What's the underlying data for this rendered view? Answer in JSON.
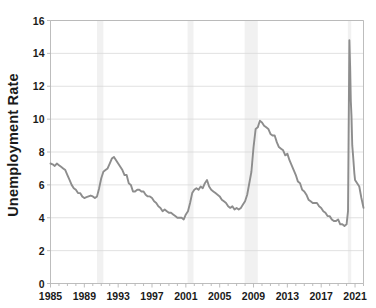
{
  "chart": {
    "ylabel_text": "Unemployment Rate",
    "line_color": "#8d8d8d",
    "recession_band_color": "#f1f1f1",
    "grid_color": "#d9d9d9",
    "axis_color": "#b5b5b5",
    "background_color": "#ffffff"
  },
  "chart_data": {
    "type": "line",
    "title": "",
    "subtitle": "",
    "xlabel": "",
    "ylabel": "Unemployment Rate",
    "xlim": [
      1985,
      2022
    ],
    "ylim": [
      0,
      16
    ],
    "ytick_labels": [
      "0",
      "2",
      "4",
      "6",
      "8",
      "10",
      "12",
      "14",
      "16"
    ],
    "ytick_values": [
      0,
      2,
      4,
      6,
      8,
      10,
      12,
      14,
      16
    ],
    "xtick_labels": [
      "1985",
      "1989",
      "1993",
      "1997",
      "2001",
      "2005",
      "2009",
      "2013",
      "2017",
      "2021"
    ],
    "xtick_values": [
      1985,
      1989,
      1993,
      1997,
      2001,
      2005,
      2009,
      2013,
      2017,
      2021
    ],
    "grid": "horizontal",
    "legend": "none",
    "annotations": [
      {
        "label": "recession band",
        "x_start": 1990.5,
        "x_end": 1991.25
      },
      {
        "label": "recession band",
        "x_start": 2001.2,
        "x_end": 2001.9
      },
      {
        "label": "recession band",
        "x_start": 2007.95,
        "x_end": 2009.5
      },
      {
        "label": "recession band",
        "x_start": 2020.15,
        "x_end": 2020.55
      }
    ],
    "series": [
      {
        "name": "Unemployment Rate",
        "color": "#8d8d8d",
        "x": [
          1985.0,
          1985.25,
          1985.5,
          1985.75,
          1986.0,
          1986.25,
          1986.5,
          1986.75,
          1987.0,
          1987.25,
          1987.5,
          1987.75,
          1988.0,
          1988.25,
          1988.5,
          1988.75,
          1989.0,
          1989.25,
          1989.5,
          1989.75,
          1990.0,
          1990.25,
          1990.5,
          1990.75,
          1991.0,
          1991.25,
          1991.5,
          1991.75,
          1992.0,
          1992.25,
          1992.5,
          1992.75,
          1993.0,
          1993.25,
          1993.5,
          1993.75,
          1994.0,
          1994.25,
          1994.5,
          1994.75,
          1995.0,
          1995.25,
          1995.5,
          1995.75,
          1996.0,
          1996.25,
          1996.5,
          1996.75,
          1997.0,
          1997.25,
          1997.5,
          1997.75,
          1998.0,
          1998.25,
          1998.5,
          1998.75,
          1999.0,
          1999.25,
          1999.5,
          1999.75,
          2000.0,
          2000.25,
          2000.5,
          2000.75,
          2001.0,
          2001.25,
          2001.5,
          2001.75,
          2002.0,
          2002.25,
          2002.5,
          2002.75,
          2003.0,
          2003.25,
          2003.5,
          2003.75,
          2004.0,
          2004.25,
          2004.5,
          2004.75,
          2005.0,
          2005.25,
          2005.5,
          2005.75,
          2006.0,
          2006.25,
          2006.5,
          2006.75,
          2007.0,
          2007.25,
          2007.5,
          2007.75,
          2008.0,
          2008.25,
          2008.5,
          2008.75,
          2009.0,
          2009.25,
          2009.5,
          2009.75,
          2010.0,
          2010.25,
          2010.5,
          2010.75,
          2011.0,
          2011.25,
          2011.5,
          2011.75,
          2012.0,
          2012.25,
          2012.5,
          2012.75,
          2013.0,
          2013.25,
          2013.5,
          2013.75,
          2014.0,
          2014.25,
          2014.5,
          2014.75,
          2015.0,
          2015.25,
          2015.5,
          2015.75,
          2016.0,
          2016.25,
          2016.5,
          2016.75,
          2017.0,
          2017.25,
          2017.5,
          2017.75,
          2018.0,
          2018.25,
          2018.5,
          2018.75,
          2019.0,
          2019.25,
          2019.5,
          2019.75,
          2020.0,
          2020.17,
          2020.33,
          2020.42,
          2020.5,
          2020.58,
          2020.67,
          2020.75,
          2020.92,
          2021.0,
          2021.25,
          2021.5,
          2021.75,
          2022.0
        ],
        "values": [
          7.3,
          7.25,
          7.15,
          7.3,
          7.2,
          7.1,
          7.0,
          6.9,
          6.6,
          6.3,
          6.0,
          5.8,
          5.7,
          5.5,
          5.5,
          5.3,
          5.2,
          5.25,
          5.3,
          5.35,
          5.3,
          5.2,
          5.3,
          5.8,
          6.4,
          6.8,
          6.9,
          7.0,
          7.3,
          7.6,
          7.7,
          7.5,
          7.3,
          7.1,
          6.9,
          6.6,
          6.6,
          6.1,
          6.0,
          5.6,
          5.6,
          5.7,
          5.7,
          5.6,
          5.6,
          5.4,
          5.3,
          5.3,
          5.2,
          5.0,
          4.9,
          4.7,
          4.6,
          4.4,
          4.5,
          4.4,
          4.3,
          4.3,
          4.2,
          4.1,
          4.0,
          4.0,
          4.0,
          3.9,
          4.2,
          4.4,
          4.9,
          5.5,
          5.7,
          5.8,
          5.7,
          5.9,
          5.8,
          6.1,
          6.3,
          5.9,
          5.7,
          5.6,
          5.5,
          5.4,
          5.3,
          5.1,
          5.0,
          4.9,
          4.7,
          4.6,
          4.7,
          4.5,
          4.6,
          4.5,
          4.6,
          4.8,
          5.0,
          5.4,
          6.1,
          6.8,
          8.3,
          9.4,
          9.5,
          9.9,
          9.8,
          9.6,
          9.5,
          9.4,
          9.1,
          9.0,
          9.0,
          8.6,
          8.3,
          8.2,
          8.1,
          7.8,
          7.9,
          7.5,
          7.2,
          6.9,
          6.6,
          6.2,
          6.1,
          5.7,
          5.6,
          5.4,
          5.1,
          5.0,
          4.9,
          4.9,
          4.9,
          4.7,
          4.6,
          4.4,
          4.3,
          4.1,
          4.1,
          3.9,
          3.8,
          3.8,
          3.9,
          3.6,
          3.6,
          3.5,
          3.6,
          4.4,
          14.8,
          13.2,
          11.1,
          10.2,
          8.4,
          7.9,
          6.7,
          6.3,
          6.1,
          5.9,
          5.2,
          4.6
        ]
      }
    ]
  }
}
